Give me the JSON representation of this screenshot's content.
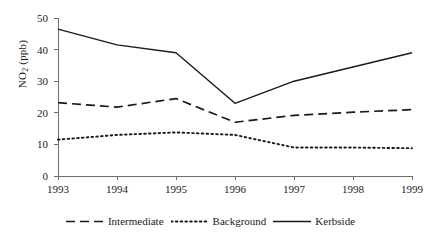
{
  "chart_data": {
    "type": "line",
    "title": "",
    "subtitle": "",
    "xlabel": "",
    "ylabel": "NO2 (ppb)",
    "ylabel_parts": {
      "base": "NO",
      "sub": "2",
      "units": " (ppb)"
    },
    "categories": [
      1993,
      1994,
      1995,
      1996,
      1997,
      1998,
      1999
    ],
    "xtick_labels": [
      "1993",
      "1994",
      "1995",
      "1996",
      "1997",
      "1998",
      "1999"
    ],
    "ytick_labels": [
      "0",
      "10",
      "20",
      "30",
      "40",
      "50"
    ],
    "yticks": [
      0,
      10,
      20,
      30,
      40,
      50
    ],
    "xlim": [
      1993,
      1999
    ],
    "ylim": [
      0,
      50
    ],
    "grid": false,
    "legend_position": "bottom-center",
    "series": [
      {
        "name": "Intermediate",
        "style": "dashed",
        "color": "#1a1a1a",
        "values": [
          23.2,
          21.8,
          24.5,
          17.0,
          19.2,
          20.2,
          21.0
        ]
      },
      {
        "name": "Background",
        "style": "dotted",
        "color": "#1a1a1a",
        "values": [
          11.5,
          13.0,
          13.8,
          13.0,
          9.0,
          9.0,
          8.8
        ]
      },
      {
        "name": "Kerbside",
        "style": "solid",
        "color": "#1a1a1a",
        "values": [
          46.5,
          41.5,
          39.0,
          23.0,
          30.0,
          34.5,
          39.0
        ]
      }
    ]
  },
  "legend": {
    "items": [
      {
        "label": "Intermediate",
        "style": "dashed"
      },
      {
        "label": "Background",
        "style": "dotted"
      },
      {
        "label": "Kerbside",
        "style": "solid"
      }
    ]
  },
  "colors": {
    "ink": "#1a1a1a",
    "axis": "#6e6e6e",
    "background": "#ffffff"
  }
}
